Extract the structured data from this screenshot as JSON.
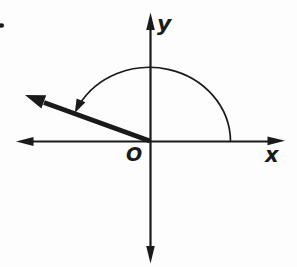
{
  "figure": {
    "type": "coordinate-plane-angle-diagram",
    "background_color": "#fdfdfd",
    "ink_color": "#1a1a1a",
    "labels": {
      "x_axis": "x",
      "y_axis": "y",
      "origin": "O"
    },
    "geometry": {
      "terminal_ray_quadrant": 2,
      "terminal_ray_angle_deg": 160,
      "angle_arc_description": "counterclockwise arc from positive x-axis to terminal ray"
    }
  }
}
